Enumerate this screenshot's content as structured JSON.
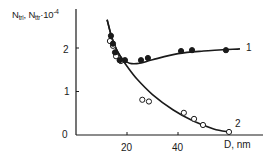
{
  "chart_data": {
    "type": "scatter",
    "title": "",
    "xlabel": "D, nm",
    "ylabel": "N_tri, N_ttr·10^-4",
    "ylabel_parts": {
      "a": "N",
      "a_sub": "tri",
      "sep": ", N",
      "b_sub": "ttr",
      "mult": "·10",
      "exp": "-4"
    },
    "xlim": [
      0,
      70
    ],
    "ylim": [
      0,
      2.9
    ],
    "xticks": [
      20,
      40
    ],
    "xtick_labels": [
      "20",
      "40"
    ],
    "yticks": [
      0,
      1,
      2
    ],
    "ytick_labels": [
      "0",
      "1",
      "2"
    ],
    "grid": false,
    "legend": "inline curve labels",
    "series": [
      {
        "name": "1",
        "marker": "filled-circle",
        "points": [
          {
            "x": 13.7,
            "y": 2.28
          },
          {
            "x": 14.5,
            "y": 2.1
          },
          {
            "x": 15.3,
            "y": 1.9
          },
          {
            "x": 17.1,
            "y": 1.72
          },
          {
            "x": 19.2,
            "y": 1.72
          },
          {
            "x": 25.5,
            "y": 1.72
          },
          {
            "x": 28.2,
            "y": 1.77
          },
          {
            "x": 41.2,
            "y": 1.93
          },
          {
            "x": 45.5,
            "y": 1.95
          },
          {
            "x": 58.8,
            "y": 1.95
          }
        ],
        "curve": [
          {
            "x": 12.2,
            "y": 2.65
          },
          {
            "x": 14,
            "y": 2.25
          },
          {
            "x": 16,
            "y": 1.95
          },
          {
            "x": 18,
            "y": 1.76
          },
          {
            "x": 21,
            "y": 1.65
          },
          {
            "x": 25,
            "y": 1.65
          },
          {
            "x": 30,
            "y": 1.73
          },
          {
            "x": 40,
            "y": 1.87
          },
          {
            "x": 50,
            "y": 1.93
          },
          {
            "x": 64.3,
            "y": 1.98
          }
        ]
      },
      {
        "name": "2",
        "marker": "open-circle",
        "points": [
          {
            "x": 13.3,
            "y": 2.16
          },
          {
            "x": 14.5,
            "y": 2.05
          },
          {
            "x": 15.7,
            "y": 1.81
          },
          {
            "x": 17.6,
            "y": 1.7
          },
          {
            "x": 26.0,
            "y": 0.81
          },
          {
            "x": 28.6,
            "y": 0.77
          },
          {
            "x": 42.3,
            "y": 0.51
          },
          {
            "x": 46.3,
            "y": 0.37
          },
          {
            "x": 49.8,
            "y": 0.23
          },
          {
            "x": 60.0,
            "y": 0.07
          }
        ],
        "curve": [
          {
            "x": 12.2,
            "y": 2.65
          },
          {
            "x": 14,
            "y": 2.25
          },
          {
            "x": 16,
            "y": 1.95
          },
          {
            "x": 18,
            "y": 1.76
          },
          {
            "x": 20,
            "y": 1.58
          },
          {
            "x": 24,
            "y": 1.28
          },
          {
            "x": 30,
            "y": 0.93
          },
          {
            "x": 38,
            "y": 0.58
          },
          {
            "x": 46,
            "y": 0.32
          },
          {
            "x": 54,
            "y": 0.14
          },
          {
            "x": 60,
            "y": 0.07
          }
        ]
      }
    ],
    "curve_labels": [
      {
        "text": "1",
        "series": "1"
      },
      {
        "text": "2",
        "series": "2"
      }
    ]
  },
  "layout": {
    "origin_px": [
      76,
      135
    ],
    "px_per_x": 2.55,
    "px_per_y": 43.5,
    "x_axis_end_px": 263,
    "y_axis_top_px": 9,
    "ink_color": "#1a1a1a"
  }
}
